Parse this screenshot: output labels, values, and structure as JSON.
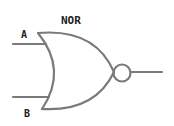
{
  "gate": {
    "type": "NOR",
    "title": "NOR",
    "inputs": [
      {
        "label": "A"
      },
      {
        "label": "B"
      }
    ],
    "stroke_color": "#7a7a7a",
    "text_color": "#222222"
  }
}
